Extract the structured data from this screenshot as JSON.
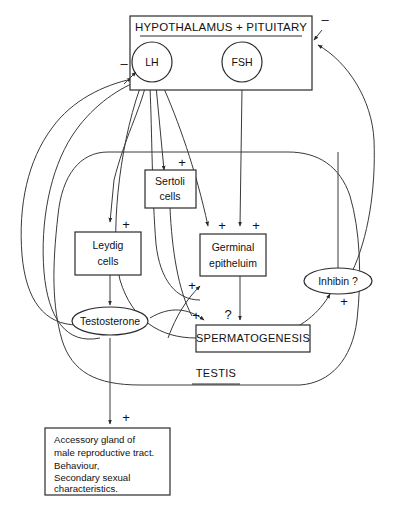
{
  "diagram": {
    "hypothalamus_box": {
      "label": "HYPOTHALAMUS + PITUITARY",
      "underlined": true
    },
    "nodes": [
      {
        "id": "lh",
        "label": "LH",
        "shape": "circle"
      },
      {
        "id": "fsh",
        "label": "FSH",
        "shape": "circle"
      },
      {
        "id": "sertoli",
        "label_line1": "Sertoli",
        "label_line2": "cells",
        "shape": "box"
      },
      {
        "id": "leydig",
        "label_line1": "Leydig",
        "label_line2": "cells",
        "shape": "box"
      },
      {
        "id": "germinal",
        "label_line1": "Germinal",
        "label_line2": "epitheluim",
        "shape": "box"
      },
      {
        "id": "inhibin",
        "label": "Inhibin ?",
        "shape": "ellipse"
      },
      {
        "id": "testosterone",
        "label": "Testosterone",
        "shape": "ellipse"
      },
      {
        "id": "spermatogenesis",
        "label": "SPERMATOGENESIS",
        "shape": "box"
      }
    ],
    "testis_label": "TESTIS",
    "effects_box": {
      "lines": [
        "Accessory gland of",
        "male reproductive tract.",
        "Behaviour,",
        "Secondary sexual",
        "characteristics."
      ]
    },
    "signs": {
      "plus": "+",
      "minus": "–",
      "question": "?"
    },
    "edge_signs": [
      {
        "id": "sign-lh-negative",
        "value": "–"
      },
      {
        "id": "sign-pituitary-negative",
        "value": "–"
      },
      {
        "id": "sign-sertoli-plus",
        "value": "+"
      },
      {
        "id": "sign-leydig-plus",
        "value": "+"
      },
      {
        "id": "sign-germinal-plus-left",
        "value": "+"
      },
      {
        "id": "sign-germinal-plus-right",
        "value": "+"
      },
      {
        "id": "sign-germinal-in-plus",
        "value": "+"
      },
      {
        "id": "sign-spermatogenesis-plus",
        "value": "+"
      },
      {
        "id": "sign-spermatogenesis-question",
        "value": "?"
      },
      {
        "id": "sign-inhibin-plus",
        "value": "+"
      },
      {
        "id": "sign-effects-plus",
        "value": "+"
      }
    ],
    "colors": {
      "stroke": "#3a3a3a",
      "shape_stroke": "#2b2b2b",
      "text": "#111111",
      "background": "#ffffff"
    }
  }
}
